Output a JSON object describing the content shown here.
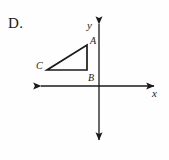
{
  "figure": {
    "choice_letter": "D.",
    "background_color": "#fefefe",
    "ink_color": "#1a1a1a",
    "axes": {
      "x_axis_label": "x",
      "y_axis_label": "y",
      "origin": {
        "x": 99,
        "y": 86
      },
      "x_axis": {
        "x1": 36,
        "y1": 86,
        "x2": 159,
        "y2": 86,
        "arrows": "both"
      },
      "y_axis": {
        "x1": 99,
        "y1": 19,
        "x2": 99,
        "y2": 145,
        "arrows": "both"
      },
      "x_label_pos": {
        "x": 154,
        "y": 95
      },
      "y_label_pos": {
        "x": 88,
        "y": 26
      }
    },
    "shape": {
      "type": "right-triangle",
      "vertices": [
        {
          "name": "A",
          "x": 87,
          "y": 45,
          "label_pos": {
            "x": 90,
            "y": 41
          }
        },
        {
          "name": "B",
          "x": 87,
          "y": 70,
          "label_pos": {
            "x": 88,
            "y": 78
          }
        },
        {
          "name": "C",
          "x": 47,
          "y": 70,
          "label_pos": {
            "x": 37,
            "y": 66
          }
        }
      ],
      "stroke_width": 1.6
    }
  }
}
